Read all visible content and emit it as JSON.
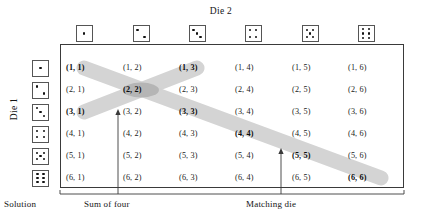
{
  "figure": {
    "top_axis_title": "Die 2",
    "left_axis_title": "Die 1",
    "solution_label": "Solution",
    "callouts": [
      {
        "name": "sum-of-four",
        "label": "Sum of four"
      },
      {
        "name": "matching-die",
        "label": "Matching die"
      }
    ]
  },
  "dice": {
    "top_faces": [
      1,
      2,
      3,
      4,
      5,
      6
    ],
    "left_faces": [
      1,
      2,
      3,
      4,
      5,
      6
    ]
  },
  "colors": {
    "band": "#d2d2d2",
    "band_overlap": "#a9a9a9",
    "frame": "#3a3a3a",
    "die_border": "#555555",
    "pip": "#111111",
    "text": "#1b1b1b"
  },
  "chart_data": {
    "type": "table",
    "xlabel": "Die 2",
    "ylabel": "Die 1",
    "categories": [
      "1",
      "2",
      "3",
      "4",
      "5",
      "6"
    ],
    "row_categories": [
      "1",
      "2",
      "3",
      "4",
      "5",
      "6"
    ],
    "grid": false,
    "legend": "none",
    "annotations": [
      "Sum of four",
      "Matching die",
      "Solution"
    ],
    "cells": [
      [
        "(1, 1)",
        "(1, 2)",
        "(1, 3)",
        "(1, 4)",
        "(1, 5)",
        "(1, 6)"
      ],
      [
        "(2, 1)",
        "(2, 2)",
        "(2, 3)",
        "(2, 4)",
        "(2, 5)",
        "(2, 6)"
      ],
      [
        "(3, 1)",
        "(3, 2)",
        "(3, 3)",
        "(3, 4)",
        "(3, 5)",
        "(3, 6)"
      ],
      [
        "(4, 1)",
        "(4, 2)",
        "(4, 3)",
        "(4, 4)",
        "(4, 5)",
        "(4, 6)"
      ],
      [
        "(5, 1)",
        "(5, 2)",
        "(5, 3)",
        "(5, 4)",
        "(5, 5)",
        "(5, 6)"
      ],
      [
        "(6, 1)",
        "(6, 2)",
        "(6, 3)",
        "(6, 4)",
        "(6, 5)",
        "(6, 6)"
      ]
    ],
    "highlighted_sum_of_four": [
      "(1, 3)",
      "(2, 2)",
      "(3, 1)"
    ],
    "highlighted_matching_die": [
      "(1, 1)",
      "(2, 2)",
      "(3, 3)",
      "(4, 4)",
      "(5, 5)",
      "(6, 6)"
    ]
  }
}
